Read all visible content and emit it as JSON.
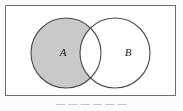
{
  "figure": {
    "kind": "venn-diagram",
    "caption": "— — — — — —",
    "colors": {
      "shaded_fill": "#c9c9c9",
      "unshaded_fill": "#ffffff",
      "outline": "#4a4a4a",
      "box_border": "#6e6e6e",
      "label_color": "#1a1a1a",
      "page_background": "#fcfcfc"
    },
    "universe_box": {
      "x": 5,
      "y": 5,
      "width": 171,
      "height": 91
    },
    "sets": [
      {
        "label": "A",
        "cx": 61,
        "cy": 48,
        "r": 35,
        "shaded": true,
        "label_x": 58,
        "label_y": 48
      },
      {
        "label": "B",
        "cx": 110,
        "cy": 48,
        "r": 35,
        "shaded": false,
        "label_x": 123,
        "label_y": 48
      }
    ],
    "shaded_region": "A minus B",
    "intersection_shaded": false
  }
}
